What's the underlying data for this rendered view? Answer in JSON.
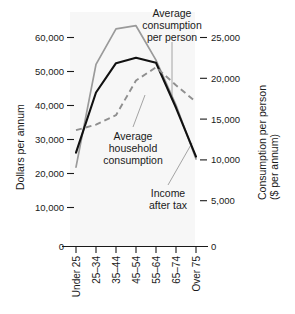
{
  "chart_data": {
    "type": "line",
    "title": "",
    "xlabel": "",
    "ylabel": "Dollars per annum",
    "y2label": "Consumption per person ($ per annum)",
    "grid": false,
    "legend_position": "inline-annotations",
    "categories": [
      "Under 25",
      "25–34",
      "35–44",
      "45–54",
      "55–64",
      "65–74",
      "Over 75"
    ],
    "ylim": [
      0,
      60000
    ],
    "y2lim": [
      0,
      25000
    ],
    "yticks": [
      "0",
      "10,000",
      "20,000",
      "30,000",
      "40,000",
      "50,000",
      "60,000"
    ],
    "ytick_values": [
      0,
      10000,
      20000,
      30000,
      40000,
      50000,
      60000
    ],
    "y2ticks": [
      "0",
      "5,000",
      "10,000",
      "15,000",
      "20,000",
      "25,000"
    ],
    "y2tick_values": [
      0,
      5000,
      10000,
      15000,
      20000,
      25000
    ],
    "series": [
      {
        "name": "Average household consumption",
        "axis": "left",
        "style": "solid",
        "color": "#9a9a9a",
        "values": [
          20300,
          46600,
          55700,
          56500,
          47700,
          36200,
          22400
        ]
      },
      {
        "name": "Income after tax",
        "axis": "left",
        "style": "solid",
        "color": "#111111",
        "values": [
          24000,
          39400,
          46900,
          48300,
          47000,
          35500,
          23000
        ]
      },
      {
        "name": "Average consumption per person",
        "axis": "right",
        "style": "dashed",
        "color": "#8f8f8f",
        "values": [
          12400,
          13000,
          14000,
          17700,
          19100,
          17200,
          15400
        ]
      }
    ],
    "annotations": [
      {
        "id": "annot-consumption-per-person",
        "lines": [
          "Average",
          "consumption",
          "per person"
        ]
      },
      {
        "id": "annot-household-consumption",
        "lines": [
          "Average",
          "household",
          "consumption"
        ]
      },
      {
        "id": "annot-income-after-tax",
        "lines": [
          "Income",
          "after tax"
        ]
      }
    ]
  },
  "axes": {
    "left_title": "Dollars per annum",
    "right_title_line1": "Consumption per person",
    "right_title_line2": "($ per annum)",
    "left_ticks": [
      "60,000",
      "50,000",
      "40,000",
      "30,000",
      "20,000",
      "10,000",
      "0"
    ],
    "right_ticks": [
      "25,000",
      "20,000",
      "15,000",
      "10,000",
      "5,000",
      "0"
    ],
    "categories": [
      "Under 25",
      "25–34",
      "35–44",
      "45–54",
      "55–64",
      "65–74",
      "Over 75"
    ]
  },
  "annotations": {
    "a1_l1": "Average",
    "a1_l2": "consumption",
    "a1_l3": "per person",
    "a2_l1": "Average",
    "a2_l2": "household",
    "a2_l3": "consumption",
    "a3_l1": "Income",
    "a3_l2": "after tax"
  },
  "colors": {
    "household": "#9a9a9a",
    "income": "#111111",
    "per_person": "#8f8f8f",
    "plot_background": "#f7f7f7",
    "axis": "#1a1a1a"
  }
}
